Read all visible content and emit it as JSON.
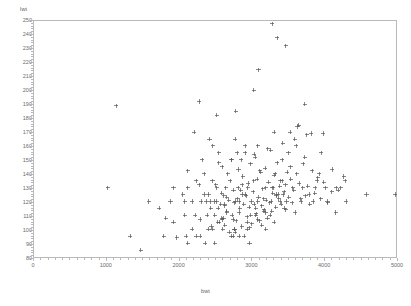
{
  "chart_data": {
    "type": "scatter",
    "title": "",
    "xlabel": "bwt",
    "ylabel": "lwt",
    "xlim": [
      0,
      5000
    ],
    "ylim": [
      80,
      250
    ],
    "xticks": [
      0,
      1000,
      2000,
      3000,
      4000,
      5000
    ],
    "yticks": [
      80,
      90,
      100,
      110,
      120,
      130,
      140,
      150,
      160,
      170,
      180,
      190,
      200,
      210,
      220,
      230,
      240,
      250
    ],
    "x_minor_step": 100,
    "y_minor_step": 2,
    "grid": false,
    "legend": null,
    "marker": "plus",
    "marker_color": "#555555",
    "marker_size": 3,
    "frame_color": "#b9b9b9",
    "background": "#ffffff",
    "n_points": 189,
    "series": [
      {
        "name": "bwt vs lwt",
        "points": [
          [
            2523,
            182
          ],
          [
            2551,
            155
          ],
          [
            2557,
            105
          ],
          [
            2594,
            108
          ],
          [
            2600,
            107
          ],
          [
            2622,
            124
          ],
          [
            2637,
            118
          ],
          [
            2637,
            103
          ],
          [
            2663,
            123
          ],
          [
            2665,
            113
          ],
          [
            2722,
            95
          ],
          [
            2733,
            150
          ],
          [
            2750,
            95
          ],
          [
            2750,
            107
          ],
          [
            2769,
            100
          ],
          [
            2769,
            100
          ],
          [
            2778,
            98
          ],
          [
            2782,
            120
          ],
          [
            2807,
            155
          ],
          [
            2821,
            130
          ],
          [
            2835,
            120
          ],
          [
            2835,
            95
          ],
          [
            2836,
            112
          ],
          [
            2863,
            150
          ],
          [
            2877,
            132
          ],
          [
            2877,
            125
          ],
          [
            2906,
            95
          ],
          [
            2920,
            155
          ],
          [
            2920,
            125
          ],
          [
            2948,
            105
          ],
          [
            2948,
            100
          ],
          [
            2955,
            130
          ],
          [
            2977,
            101
          ],
          [
            2977,
            90
          ],
          [
            2992,
            110
          ],
          [
            3005,
            120
          ],
          [
            3033,
            135
          ],
          [
            3042,
            154
          ],
          [
            3062,
            110
          ],
          [
            3062,
            115
          ],
          [
            3090,
            160
          ],
          [
            3090,
            120
          ],
          [
            3093,
            107
          ],
          [
            3119,
            142
          ],
          [
            3147,
            103
          ],
          [
            3175,
            122
          ],
          [
            3175,
            113
          ],
          [
            3203,
            130
          ],
          [
            3203,
            100
          ],
          [
            3203,
            112
          ],
          [
            3231,
            158
          ],
          [
            3260,
            110
          ],
          [
            3274,
            120
          ],
          [
            3288,
            130
          ],
          [
            3303,
            130
          ],
          [
            3317,
            170
          ],
          [
            3317,
            105
          ],
          [
            3331,
            140
          ],
          [
            3345,
            124
          ],
          [
            3345,
            125
          ],
          [
            3374,
            125
          ],
          [
            3402,
            135
          ],
          [
            3402,
            120
          ],
          [
            3430,
            135
          ],
          [
            3430,
            150
          ],
          [
            3444,
            125
          ],
          [
            3459,
            115
          ],
          [
            3473,
            132
          ],
          [
            3487,
            120
          ],
          [
            3515,
            155
          ],
          [
            3544,
            145
          ],
          [
            3572,
            130
          ],
          [
            3600,
            165
          ],
          [
            3629,
            140
          ],
          [
            3657,
            175
          ],
          [
            3685,
            122
          ],
          [
            3714,
            130
          ],
          [
            3742,
            190
          ],
          [
            3770,
            168
          ],
          [
            3799,
            125
          ],
          [
            3827,
            169
          ],
          [
            3856,
            120
          ],
          [
            3884,
            130
          ],
          [
            3912,
            135
          ],
          [
            3941,
            140
          ],
          [
            3969,
            155
          ],
          [
            3997,
            169
          ],
          [
            4026,
            130
          ],
          [
            4054,
            120
          ],
          [
            4111,
            127
          ],
          [
            4167,
            112
          ],
          [
            4174,
            130
          ],
          [
            4238,
            130
          ],
          [
            4281,
            138
          ],
          [
            4310,
            120
          ],
          [
            4593,
            125
          ],
          [
            4990,
            125
          ],
          [
            1021,
            130
          ],
          [
            1135,
            189
          ],
          [
            1330,
            95
          ],
          [
            1474,
            85
          ],
          [
            1588,
            120
          ],
          [
            1729,
            115
          ],
          [
            1790,
            95
          ],
          [
            1818,
            108
          ],
          [
            1885,
            120
          ],
          [
            1928,
            105
          ],
          [
            1928,
            130
          ],
          [
            1970,
            94
          ],
          [
            2055,
            125
          ],
          [
            2082,
            110
          ],
          [
            2084,
            120
          ],
          [
            2100,
            95
          ],
          [
            2125,
            90
          ],
          [
            2126,
            142
          ],
          [
            2126,
            130
          ],
          [
            2187,
            120
          ],
          [
            2187,
            100
          ],
          [
            2211,
            170
          ],
          [
            2225,
            110
          ],
          [
            2240,
            95
          ],
          [
            2240,
            135
          ],
          [
            2282,
            132
          ],
          [
            2296,
            107
          ],
          [
            2296,
            95
          ],
          [
            2310,
            120
          ],
          [
            2325,
            150
          ],
          [
            2353,
            125
          ],
          [
            2353,
            140
          ],
          [
            2367,
            90
          ],
          [
            2381,
            120
          ],
          [
            2395,
            110
          ],
          [
            2410,
            100
          ],
          [
            2410,
            125
          ],
          [
            2424,
            165
          ],
          [
            2438,
            120
          ],
          [
            2440,
            115
          ],
          [
            2452,
            102
          ],
          [
            2466,
            135
          ],
          [
            2466,
            100
          ],
          [
            2467,
            160
          ],
          [
            2495,
            120
          ],
          [
            2495,
            110
          ],
          [
            2495,
            90
          ],
          [
            2509,
            132
          ],
          [
            2523,
            130
          ],
          [
            2523,
            120
          ],
          [
            2540,
            105
          ],
          [
            2545,
            115
          ],
          [
            2552,
            148
          ],
          [
            2580,
            118
          ],
          [
            2594,
            126
          ],
          [
            2600,
            145
          ],
          [
            2608,
            100
          ],
          [
            2620,
            108
          ],
          [
            2635,
            117
          ],
          [
            2650,
            130
          ],
          [
            2661,
            112
          ],
          [
            2676,
            140
          ],
          [
            2690,
            121
          ],
          [
            2700,
            98
          ],
          [
            2712,
            135
          ],
          [
            2725,
            150
          ],
          [
            2740,
            110
          ],
          [
            2755,
            128
          ],
          [
            2768,
            119
          ],
          [
            2780,
            165
          ],
          [
            2795,
            106
          ],
          [
            2810,
            122
          ],
          [
            2825,
            143
          ],
          [
            2840,
            115
          ],
          [
            2855,
            128
          ],
          [
            2870,
            102
          ],
          [
            2885,
            138
          ],
          [
            2900,
            118
          ],
          [
            2915,
            160
          ],
          [
            2930,
            124
          ],
          [
            2945,
            109
          ],
          [
            2960,
            133
          ],
          [
            2975,
            116
          ],
          [
            2990,
            147
          ],
          [
            3010,
            104
          ],
          [
            3025,
            127
          ],
          [
            3040,
            118
          ],
          [
            3055,
            152
          ],
          [
            3070,
            111
          ],
          [
            3085,
            136
          ],
          [
            3100,
            123
          ],
          [
            3115,
            106
          ],
          [
            3130,
            141
          ],
          [
            3145,
            117
          ],
          [
            3160,
            129
          ],
          [
            3180,
            114
          ],
          [
            3195,
            144
          ],
          [
            3210,
            121
          ],
          [
            3225,
            108
          ],
          [
            3240,
            134
          ],
          [
            3255,
            119
          ],
          [
            3270,
            157
          ],
          [
            3285,
            113
          ],
          [
            3300,
            126
          ],
          [
            3315,
            139
          ],
          [
            3340,
            116
          ],
          [
            3360,
            148
          ],
          [
            3380,
            122
          ],
          [
            3395,
            131
          ],
          [
            3415,
            118
          ],
          [
            3435,
            162
          ],
          [
            3455,
            127
          ],
          [
            3480,
            114
          ],
          [
            3500,
            141
          ],
          [
            3520,
            123
          ],
          [
            3545,
            136
          ],
          [
            3565,
            119
          ],
          [
            3590,
            128
          ],
          [
            3610,
            112
          ],
          [
            3640,
            174
          ],
          [
            3665,
            133
          ],
          [
            3690,
            120
          ],
          [
            3720,
            147
          ],
          [
            3750,
            124
          ],
          [
            3780,
            131
          ],
          [
            3810,
            118
          ],
          [
            3845,
            142
          ],
          [
            3880,
            126
          ],
          [
            3920,
            137
          ],
          [
            3960,
            122
          ],
          [
            4005,
            134
          ],
          [
            4060,
            119
          ],
          [
            4120,
            143
          ],
          [
            4200,
            128
          ],
          [
            4300,
            135
          ],
          [
            3290,
            248
          ],
          [
            3360,
            238
          ],
          [
            3100,
            215
          ],
          [
            3035,
            200
          ],
          [
            2790,
            185
          ],
          [
            3480,
            232
          ],
          [
            2280,
            192
          ],
          [
            3540,
            170
          ],
          [
            3620,
            160
          ],
          [
            3740,
            152
          ]
        ]
      }
    ]
  },
  "axes": {
    "y_title": "lwt",
    "x_title": "bwt",
    "y_tick_labels": [
      "250",
      "240",
      "230",
      "220",
      "210",
      "200",
      "190",
      "180",
      "170",
      "160",
      "150",
      "140",
      "130",
      "120",
      "110",
      "100",
      "90",
      "80"
    ],
    "x_tick_labels": [
      "0",
      "1000",
      "2000",
      "3000",
      "4000",
      "5000"
    ]
  }
}
